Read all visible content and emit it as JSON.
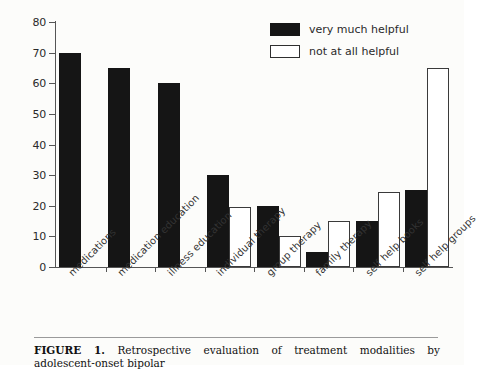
{
  "chart_data": {
    "type": "bar",
    "title": "",
    "xlabel": "",
    "ylabel": "Percent",
    "ylim": [
      0,
      80
    ],
    "ytick_step": 10,
    "yticks": [
      0,
      10,
      20,
      30,
      40,
      50,
      60,
      70,
      80
    ],
    "grid": false,
    "legend_position": "top-right",
    "categories": [
      "medications",
      "medication education",
      "illness education",
      "individual therapy",
      "group therapy",
      "family therapy",
      "self help books",
      "self help groups"
    ],
    "series": [
      {
        "name": "very much helpful",
        "color": "#151515",
        "style": "filled",
        "values": [
          70,
          65,
          60,
          30,
          20,
          5,
          15,
          25
        ]
      },
      {
        "name": "not at all helpful",
        "color": "#ffffff",
        "style": "outlined",
        "values": [
          0,
          0,
          0,
          19.5,
          10,
          15,
          24.5,
          65
        ]
      }
    ]
  },
  "legend": {
    "items": [
      {
        "label": "very much helpful",
        "swatch": "dark"
      },
      {
        "label": "not at all helpful",
        "swatch": "light"
      }
    ]
  },
  "caption": {
    "label": "FIGURE 1.",
    "text": " Retrospective evaluation of treatment modalities by adolescent-onset bipolar"
  }
}
